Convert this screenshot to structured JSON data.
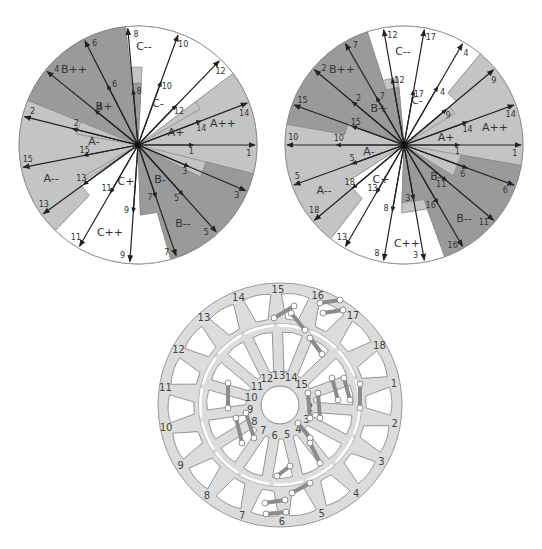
{
  "colors": {
    "background": "#ffffff",
    "sector_light": "#c4c4c4",
    "sector_dark": "#9a9a9a",
    "sector_white": "#ffffff",
    "arrow": "#222222",
    "outline": "#8a8a8a",
    "stator_fill": "#dcdcdc",
    "coil": "#8c8c8c"
  },
  "left_diagram": {
    "name": "15-slot phasor star",
    "slots": 15,
    "center": [
      138,
      145
    ],
    "radius": 119,
    "vectors": [
      {
        "label": "1",
        "angle": 0
      },
      {
        "label": "14",
        "angle": 21
      },
      {
        "label": "12",
        "angle": 46
      },
      {
        "label": "10",
        "angle": 70
      },
      {
        "label": "8",
        "angle": 95
      },
      {
        "label": "6",
        "angle": 117
      },
      {
        "label": "4",
        "angle": 141
      },
      {
        "label": "2",
        "angle": 166
      },
      {
        "label": "15",
        "angle": 191
      },
      {
        "label": "13",
        "angle": 216
      },
      {
        "label": "11",
        "angle": 240
      },
      {
        "label": "9",
        "angle": 266
      },
      {
        "label": "7",
        "angle": 289
      },
      {
        "label": "5",
        "angle": 312
      },
      {
        "label": "3",
        "angle": 337
      }
    ],
    "sectors": [
      {
        "label": "A++",
        "from": -12,
        "to": 37,
        "tone": "light",
        "inner_from": -12,
        "inner_to": 30
      },
      {
        "label": "C-",
        "from": 37,
        "to": 58,
        "tone": "white"
      },
      {
        "label": "C--",
        "from": 58,
        "to": 100,
        "tone": "white"
      },
      {
        "label": "B+",
        "from": 100,
        "to": 155,
        "tone": "dark"
      },
      {
        "label": "B++",
        "from": 100,
        "to": 155,
        "tone": "dark"
      },
      {
        "label": "A-",
        "from": 155,
        "to": 205,
        "tone": "light"
      },
      {
        "label": "A--",
        "from": 155,
        "to": 228,
        "tone": "light"
      },
      {
        "label": "C+",
        "from": 228,
        "to": 272,
        "tone": "white"
      },
      {
        "label": "C++",
        "from": 228,
        "to": 282,
        "tone": "white"
      },
      {
        "label": "B-",
        "from": 272,
        "to": 348,
        "tone": "dark"
      },
      {
        "label": "B--",
        "from": 282,
        "to": 348,
        "tone": "dark"
      },
      {
        "label": "A+",
        "from": -12,
        "to": 37,
        "tone": "light"
      }
    ],
    "sector_labels": [
      {
        "text": "C--",
        "x": 144,
        "y": 50
      },
      {
        "text": "C-",
        "x": 158,
        "y": 107
      },
      {
        "text": "B++",
        "x": 74,
        "y": 73
      },
      {
        "text": "B+",
        "x": 104,
        "y": 110
      },
      {
        "text": "A++",
        "x": 223,
        "y": 127
      },
      {
        "text": "A+",
        "x": 176,
        "y": 136
      },
      {
        "text": "A-",
        "x": 94,
        "y": 145
      },
      {
        "text": "A--",
        "x": 51,
        "y": 182
      },
      {
        "text": "C+",
        "x": 126,
        "y": 185
      },
      {
        "text": "C++",
        "x": 110,
        "y": 236
      },
      {
        "text": "B-",
        "x": 160,
        "y": 183
      },
      {
        "text": "B--",
        "x": 183,
        "y": 227
      }
    ]
  },
  "right_diagram": {
    "name": "18-slot phasor star",
    "slots": 18,
    "center": [
      133,
      145
    ],
    "radius": 119,
    "vectors": [
      {
        "label": "1",
        "angle": 0
      },
      {
        "label": "14",
        "angle": 20
      },
      {
        "label": "9",
        "angle": 40
      },
      {
        "label": "4",
        "angle": 60
      },
      {
        "label": "17",
        "angle": 80
      },
      {
        "label": "12",
        "angle": 100
      },
      {
        "label": "7",
        "angle": 120
      },
      {
        "label": "2",
        "angle": 140
      },
      {
        "label": "15",
        "angle": 160
      },
      {
        "label": "10",
        "angle": 180
      },
      {
        "label": "5",
        "angle": 200
      },
      {
        "label": "18",
        "angle": 220
      },
      {
        "label": "13",
        "angle": 240
      },
      {
        "label": "8",
        "angle": 260
      },
      {
        "label": "3",
        "angle": 280
      },
      {
        "label": "16",
        "angle": 300
      },
      {
        "label": "11",
        "angle": 320
      },
      {
        "label": "6",
        "angle": 340
      }
    ],
    "sector_labels": [
      {
        "text": "C--",
        "x": 132,
        "y": 55
      },
      {
        "text": "C-",
        "x": 146,
        "y": 104
      },
      {
        "text": "B++",
        "x": 71,
        "y": 73
      },
      {
        "text": "B+",
        "x": 108,
        "y": 112
      },
      {
        "text": "A++",
        "x": 224,
        "y": 131
      },
      {
        "text": "A+",
        "x": 175,
        "y": 141
      },
      {
        "text": "A-",
        "x": 98,
        "y": 155
      },
      {
        "text": "A--",
        "x": 53,
        "y": 194
      },
      {
        "text": "C+",
        "x": 110,
        "y": 183
      },
      {
        "text": "C++",
        "x": 136,
        "y": 247
      },
      {
        "text": "B-",
        "x": 165,
        "y": 180
      },
      {
        "text": "B--",
        "x": 193,
        "y": 222
      }
    ]
  },
  "stator": {
    "name": "stator and rotor winding layout",
    "center": [
      130,
      127
    ],
    "outer_radius": 122,
    "gap_radius": 80,
    "bore_radius": 19,
    "outer_slots": [
      "1",
      "2",
      "3",
      "4",
      "5",
      "6",
      "7",
      "8",
      "9",
      "10",
      "11",
      "12",
      "13",
      "14",
      "15",
      "16",
      "17",
      "18"
    ],
    "inner_slots": [
      "1",
      "2",
      "3",
      "4",
      "5",
      "6",
      "7",
      "8",
      "9",
      "10",
      "11",
      "12",
      "13",
      "14",
      "15"
    ]
  }
}
